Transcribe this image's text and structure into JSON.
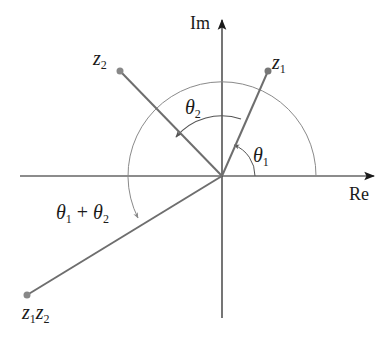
{
  "diagram": {
    "type": "complex-plane-multiplication",
    "axes": {
      "real_label": "Re",
      "imag_label": "Im"
    },
    "points": [
      {
        "id": "z1",
        "label": "z",
        "sub": "1"
      },
      {
        "id": "z2",
        "label": "z",
        "sub": "2"
      },
      {
        "id": "z1z2",
        "label": "z",
        "sub": "1",
        "label2": "z",
        "sub2": "2"
      }
    ],
    "angles": {
      "theta1": {
        "symbol": "θ",
        "sub": "1"
      },
      "theta2": {
        "symbol": "θ",
        "sub": "2"
      },
      "sum": {
        "symbol": "θ",
        "sub": "1",
        "plus": " + ",
        "symbol2": "θ",
        "sub2": "2"
      }
    },
    "colors": {
      "axis": "#1a1a1a",
      "vector": "#6e6e6e",
      "arc": "#8a8a8a",
      "point": "#777777"
    }
  }
}
